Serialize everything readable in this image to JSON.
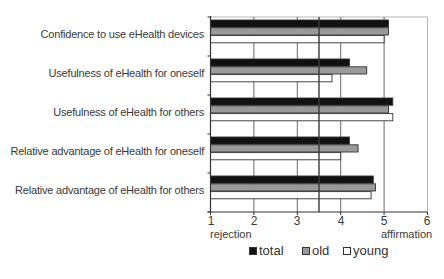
{
  "chart_data": {
    "type": "bar",
    "orientation": "horizontal",
    "title": "",
    "xlabel": "",
    "ylabel": "",
    "xlim": [
      1,
      6
    ],
    "x_ticks": [
      "1",
      "2",
      "3",
      "4",
      "5",
      "6"
    ],
    "x_end_labels": {
      "left": "rejection",
      "right": "affirmation"
    },
    "reference_line": 3.5,
    "grid": true,
    "legend_position": "bottom",
    "categories": [
      "Confidence to use eHealth devices",
      "Usefulness of eHealth for oneself",
      "Usefulness of eHealth for others",
      "Relative advantage of eHealth for oneself",
      "Relative advantage of eHealth for others"
    ],
    "series": [
      {
        "name": "total",
        "color": "#111111",
        "values": [
          5.1,
          4.2,
          5.2,
          4.2,
          4.75
        ]
      },
      {
        "name": "old",
        "color": "#9a9a9a",
        "values": [
          5.1,
          4.6,
          5.1,
          4.4,
          4.8
        ]
      },
      {
        "name": "young",
        "color": "#ffffff",
        "values": [
          5.0,
          3.8,
          5.2,
          4.0,
          4.7
        ]
      }
    ]
  },
  "legend": {
    "items": [
      {
        "label": "total",
        "color": "#111111"
      },
      {
        "label": "old",
        "color": "#9a9a9a"
      },
      {
        "label": "young",
        "color": "#ffffff"
      }
    ]
  }
}
